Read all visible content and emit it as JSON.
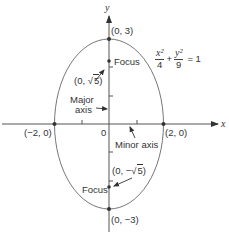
{
  "diagram": {
    "type": "ellipse",
    "equation": {
      "x_num": "x²",
      "x_den": "4",
      "plus": "+",
      "y_num": "y²",
      "y_den": "9",
      "rhs": "= 1"
    },
    "axes": {
      "x_label": "x",
      "y_label": "y"
    },
    "points": {
      "top": "(0, 3)",
      "bottom": "(0, −3)",
      "left": "(−2, 0)",
      "right": "(2, 0)",
      "origin": "0",
      "focus_upper_prefix": "(0, ",
      "focus_upper_val": "5",
      "focus_upper_suffix": ")",
      "focus_lower_prefix": "(0, −",
      "focus_lower_val": "5",
      "focus_lower_suffix": ")"
    },
    "labels": {
      "focus_upper": "Focus",
      "focus_lower": "Focus",
      "major_axis_line1": "Major",
      "major_axis_line2": "axis",
      "minor_axis": "Minor axis",
      "sqrt_symbol": "√"
    },
    "colors": {
      "stroke": "#555555",
      "text": "#333333",
      "point": "#333333"
    }
  }
}
